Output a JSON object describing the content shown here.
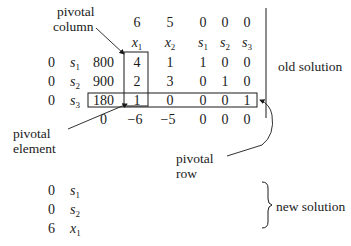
{
  "tableau": {
    "objective_coefficients": [
      "6",
      "5",
      "0",
      "0",
      "0"
    ],
    "variables": [
      {
        "base": "x",
        "sub": "1"
      },
      {
        "base": "x",
        "sub": "2"
      },
      {
        "base": "s",
        "sub": "1"
      },
      {
        "base": "s",
        "sub": "2"
      },
      {
        "base": "s",
        "sub": "3"
      }
    ],
    "rows": [
      {
        "cb": "0",
        "basis": {
          "base": "s",
          "sub": "1"
        },
        "rhs": "800",
        "values": [
          "4",
          "1",
          "1",
          "0",
          "0"
        ]
      },
      {
        "cb": "0",
        "basis": {
          "base": "s",
          "sub": "2"
        },
        "rhs": "900",
        "values": [
          "2",
          "3",
          "0",
          "1",
          "0"
        ]
      },
      {
        "cb": "0",
        "basis": {
          "base": "s",
          "sub": "3"
        },
        "rhs": "180",
        "values": [
          "1",
          "0",
          "0",
          "0",
          "1"
        ]
      }
    ],
    "bottom_row": {
      "rhs": "0",
      "values": [
        "−6",
        "−5",
        "0",
        "0",
        "0"
      ]
    }
  },
  "annotations": {
    "pivotal_column": [
      "pivotal",
      "column"
    ],
    "pivotal_element": [
      "pivotal",
      "element"
    ],
    "pivotal_row": [
      "pivotal",
      "row"
    ],
    "old_solution": "old solution",
    "new_solution": "new solution"
  },
  "new_basis": [
    {
      "cb": "0",
      "basis": {
        "base": "s",
        "sub": "1"
      }
    },
    {
      "cb": "0",
      "basis": {
        "base": "s",
        "sub": "2"
      }
    },
    {
      "cb": "6",
      "basis": {
        "base": "x",
        "sub": "1"
      }
    }
  ]
}
